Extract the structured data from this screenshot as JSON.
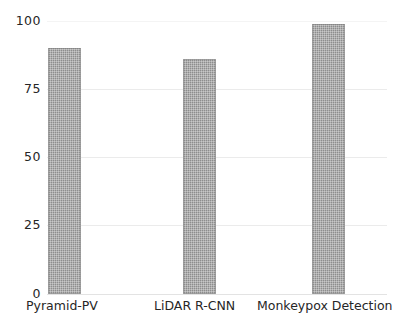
{
  "chart_data": {
    "type": "bar",
    "title": "",
    "subtitle": "",
    "xlabel": "",
    "ylabel": "",
    "categories": [
      "Pyramid-PV",
      "LiDAR R-CNN",
      "Monkeypox Detection"
    ],
    "values": [
      90,
      86,
      99
    ],
    "series": [
      {
        "name": "Accuracy",
        "values": [
          90,
          86,
          99
        ]
      }
    ],
    "ylim": [
      0,
      100
    ],
    "y_ticks": [
      100,
      75,
      50,
      25,
      0
    ],
    "y_tick_labels": [
      "100",
      "75",
      "50",
      "25",
      "0"
    ],
    "grid": true,
    "grid_axis": "y",
    "legend": false,
    "legend_position": "none",
    "annotations": [],
    "bar_color": "#8d8d8d",
    "grid_color": "#ebebeb",
    "text_color": "#262626",
    "background_color": "#ffffff"
  },
  "axes": {
    "y": {
      "ticks": [
        {
          "label": "100",
          "value": 100
        },
        {
          "label": "75",
          "value": 75
        },
        {
          "label": "50",
          "value": 50
        },
        {
          "label": "25",
          "value": 25
        },
        {
          "label": "0",
          "value": 0
        }
      ]
    },
    "x": {
      "ticks": [
        {
          "label": "Pyramid-PV"
        },
        {
          "label": "LiDAR R-CNN"
        },
        {
          "label": "Monkeypox Detection"
        }
      ]
    }
  }
}
